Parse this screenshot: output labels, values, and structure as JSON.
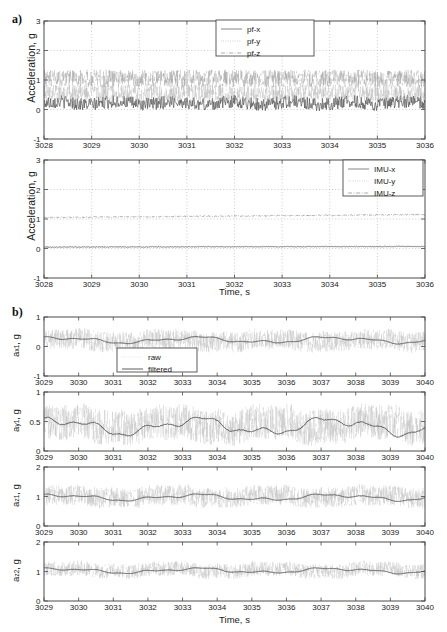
{
  "figure": {
    "panel_a_label": "a)",
    "panel_b_label": "b)",
    "axis_label_acceleration": "Acceleration, g",
    "axis_label_time": "Time, s"
  },
  "labels": {
    "ax1": "a",
    "ax1_sub": "x1",
    "ax1_unit": ", g",
    "ay1": "a",
    "ay1_sub": "y1",
    "az1": "a",
    "az1_sub": "z1",
    "az2": "a",
    "az2_sub": "z2",
    "unit_g": ", g"
  },
  "legends": {
    "pf": [
      "pf-x",
      "pf-y",
      "pf-z"
    ],
    "imu": [
      "IMU-x",
      "IMU-y",
      "IMU-z"
    ],
    "raw_filtered": [
      "raw",
      "filtered"
    ]
  },
  "colors": {
    "frame": "#4a4a4a",
    "grid": "#aaaaaa",
    "solid_series": "#555555",
    "dotted_series": "#999999",
    "dashdot_series": "#777777",
    "raw_series": "#b0b0b0",
    "filtered_series": "#4a4a4a",
    "background": "#ffffff"
  },
  "chart_data": [
    {
      "id": "a-top",
      "type": "line",
      "title": "",
      "xlabel": "",
      "ylabel": "Acceleration, g",
      "xlim": [
        3028,
        3036
      ],
      "ylim": [
        -1,
        3
      ],
      "xticks": [
        3028,
        3029,
        3030,
        3031,
        3032,
        3033,
        3034,
        3035,
        3036
      ],
      "yticks": [
        -1,
        0,
        1,
        2,
        3
      ],
      "grid": true,
      "legend": [
        "pf-x",
        "pf-y",
        "pf-z"
      ],
      "legend_position": "top-center",
      "series": [
        {
          "name": "pf-x",
          "style": "solid",
          "mean": 0.22,
          "noise": 0.22,
          "description": "noisy signal oscillating about 0.2 g, range roughly -0.2 to 0.7 g"
        },
        {
          "name": "pf-y",
          "style": "dotted",
          "mean": 0.55,
          "noise": 0.3,
          "description": "noisy signal scattered between 0.1 and 1.1 g"
        },
        {
          "name": "pf-z",
          "style": "dashdot",
          "mean": 1.05,
          "noise": 0.3,
          "description": "noisy signal about 1.05 g, spikes to 1.7 g"
        }
      ]
    },
    {
      "id": "a-bottom",
      "type": "line",
      "title": "",
      "xlabel": "Time, s",
      "ylabel": "Acceleration, g",
      "xlim": [
        3028,
        3036
      ],
      "ylim": [
        -1,
        3
      ],
      "xticks": [
        3028,
        3029,
        3030,
        3031,
        3032,
        3033,
        3034,
        3035,
        3036
      ],
      "yticks": [
        -1,
        0,
        1,
        2,
        3
      ],
      "grid": true,
      "legend": [
        "IMU-x",
        "IMU-y",
        "IMU-z"
      ],
      "legend_position": "top-right",
      "series": [
        {
          "name": "IMU-x",
          "style": "solid",
          "mean": 0.05,
          "noise": 0.015,
          "description": "nearly flat near 0.05 g"
        },
        {
          "name": "IMU-y",
          "style": "dotted",
          "mean": 0.04,
          "noise": 0.01,
          "description": "nearly flat near 0.04 g, overlaps IMU-x"
        },
        {
          "name": "IMU-z",
          "style": "dashdot",
          "mean": 1.05,
          "noise": 0.02,
          "description": "nearly flat near 1.05 g rising slightly to 1.15 g"
        }
      ]
    },
    {
      "id": "b-1",
      "type": "line",
      "title": "",
      "xlabel": "",
      "ylabel": "a_x1, g",
      "xlim": [
        3029,
        3040
      ],
      "ylim": [
        -1,
        1
      ],
      "xticks": [
        3029,
        3030,
        3031,
        3032,
        3033,
        3034,
        3035,
        3036,
        3037,
        3038,
        3039,
        3040
      ],
      "yticks": [
        -1,
        0,
        1
      ],
      "grid": false,
      "legend": [
        "raw",
        "filtered"
      ],
      "legend_position": "center-left-inside",
      "series": [
        {
          "name": "raw",
          "style": "dotted",
          "mean": 0.2,
          "noise": 0.35,
          "description": "dense scatter band roughly -0.4 to 0.8 g"
        },
        {
          "name": "filtered",
          "style": "solid",
          "mean": 0.22,
          "noise": 0.06,
          "description": "smooth wave oscillating between 0.12 and 0.32 g"
        }
      ]
    },
    {
      "id": "b-2",
      "type": "line",
      "title": "",
      "xlabel": "",
      "ylabel": "a_y1, g",
      "xlim": [
        3029,
        3040
      ],
      "ylim": [
        0,
        1
      ],
      "xticks": [
        3029,
        3030,
        3031,
        3032,
        3033,
        3034,
        3035,
        3036,
        3037,
        3038,
        3039,
        3040
      ],
      "yticks": [
        0,
        0.5,
        1
      ],
      "grid": false,
      "legend": [],
      "series": [
        {
          "name": "raw",
          "style": "dotted",
          "mean": 0.45,
          "noise": 0.3,
          "description": "dense scatter filling 0 to 1 g"
        },
        {
          "name": "filtered",
          "style": "solid",
          "mean": 0.42,
          "noise": 0.08,
          "description": "smooth wave between 0.30 and 0.56 g"
        }
      ]
    },
    {
      "id": "b-3",
      "type": "line",
      "title": "",
      "xlabel": "",
      "ylabel": "a_z1, g",
      "xlim": [
        3029,
        3040
      ],
      "ylim": [
        0,
        2
      ],
      "xticks": [
        3029,
        3030,
        3031,
        3032,
        3033,
        3034,
        3035,
        3036,
        3037,
        3038,
        3039,
        3040
      ],
      "yticks": [
        0,
        1,
        2
      ],
      "grid": false,
      "legend": [],
      "series": [
        {
          "name": "raw",
          "style": "dotted",
          "mean": 1.0,
          "noise": 0.35,
          "description": "dense scatter about 1 g"
        },
        {
          "name": "filtered",
          "style": "solid",
          "mean": 0.97,
          "noise": 0.06,
          "description": "smooth wave between 0.88 and 1.10 g"
        }
      ]
    },
    {
      "id": "b-4",
      "type": "line",
      "title": "",
      "xlabel": "Time, s",
      "ylabel": "a_z2, g",
      "xlim": [
        3029,
        3040
      ],
      "ylim": [
        0,
        2
      ],
      "xticks": [
        3029,
        3030,
        3031,
        3032,
        3033,
        3034,
        3035,
        3036,
        3037,
        3038,
        3039,
        3040
      ],
      "yticks": [
        0,
        1,
        2
      ],
      "grid": false,
      "legend": [],
      "series": [
        {
          "name": "raw",
          "style": "dotted",
          "mean": 1.05,
          "noise": 0.25,
          "description": "dense scatter about 1.05 g"
        },
        {
          "name": "filtered",
          "style": "solid",
          "mean": 1.03,
          "noise": 0.05,
          "description": "smooth wave between 0.96 and 1.15 g"
        }
      ]
    }
  ]
}
